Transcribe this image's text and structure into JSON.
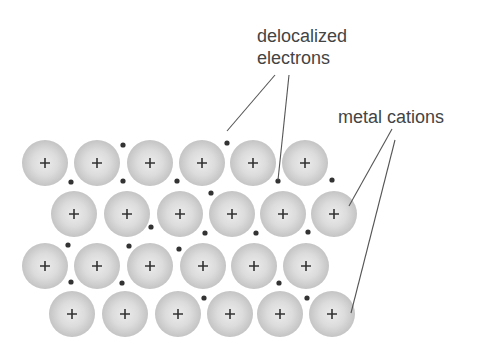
{
  "diagram": {
    "labels": {
      "electrons_line1": "delocalized",
      "electrons_line2": "electrons",
      "cations": "metal cations"
    },
    "colors": {
      "text": "#444444",
      "cation_center": "#ececec",
      "cation_edge": "#c4c4c4",
      "plus": "#333333",
      "electron": "#333333",
      "leader_line": "#555555"
    },
    "cation_symbol": "+",
    "cation_radius": 23,
    "cation_rows": [
      {
        "y": 163,
        "x": [
          45,
          97,
          150,
          202,
          253,
          305
        ]
      },
      {
        "y": 214,
        "x": [
          74,
          127,
          180,
          232,
          283,
          334
        ]
      },
      {
        "y": 266,
        "x": [
          45,
          97,
          150,
          203,
          254,
          306
        ]
      },
      {
        "y": 314,
        "x": [
          72,
          125,
          178,
          230,
          280,
          332
        ]
      }
    ],
    "electrons": [
      [
        123,
        145
      ],
      [
        227,
        143
      ],
      [
        71,
        182
      ],
      [
        123,
        181
      ],
      [
        177,
        181
      ],
      [
        278,
        181
      ],
      [
        332,
        180
      ],
      [
        211,
        193
      ],
      [
        151,
        227
      ],
      [
        205,
        233
      ],
      [
        256,
        233
      ],
      [
        308,
        232
      ],
      [
        68,
        245
      ],
      [
        129,
        246
      ],
      [
        179,
        249
      ],
      [
        71,
        282
      ],
      [
        122,
        283
      ],
      [
        279,
        283
      ],
      [
        204,
        298
      ],
      [
        307,
        298
      ]
    ],
    "leader_lines": [
      {
        "from": [
          275,
          75
        ],
        "to": [
          227,
          131
        ],
        "target": "electron"
      },
      {
        "from": [
          289,
          75
        ],
        "to": [
          278,
          180
        ],
        "target": "electron"
      },
      {
        "from": [
          392,
          129
        ],
        "to": [
          349,
          206
        ],
        "target": "cation"
      },
      {
        "from": [
          395,
          140
        ],
        "to": [
          351,
          313
        ],
        "target": "cation"
      }
    ]
  }
}
